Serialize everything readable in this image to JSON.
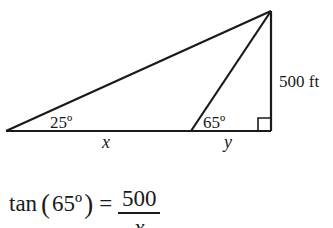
{
  "diagram": {
    "type": "right-triangle-trig-problem",
    "line_color": "#1a1a1a",
    "background": "#ffffff",
    "vertices": {
      "left": [
        6,
        131
      ],
      "middle": [
        191,
        131
      ],
      "right_bottom": [
        271,
        131
      ],
      "apex": [
        271,
        11
      ]
    },
    "labels": {
      "angle_left": "25º",
      "angle_middle": "65º",
      "height": "500 ft",
      "segment_x": "x",
      "segment_y": "y"
    },
    "right_angle_marker": true
  },
  "equation": {
    "function": "tan",
    "open_paren": "(",
    "argument": "65º",
    "close_paren": ")",
    "equals": "=",
    "numerator": "500",
    "denominator": "x"
  }
}
